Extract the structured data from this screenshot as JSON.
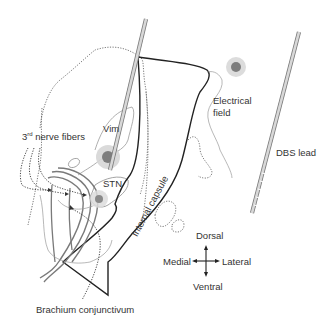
{
  "diagram": {
    "labels": {
      "vim": "Vim",
      "stn": "STN",
      "third_nerve_prefix": "3",
      "third_nerve_sup": "rd",
      "third_nerve_suffix": " nerve fibers",
      "internal_capsule": "Internal capsule",
      "electrical_field_line1": "Electrical",
      "electrical_field_line2": "field",
      "dbs_lead": "DBS lead",
      "brachium": "Brachium conjunctivum"
    },
    "compass": {
      "dorsal": "Dorsal",
      "ventral": "Ventral",
      "medial": "Medial",
      "lateral": "Lateral"
    },
    "colors": {
      "outline": "#222222",
      "dotted": "#555555",
      "thin_gray": "#9a9a9a",
      "fiber_gray": "#7a7a7a",
      "field_halo": "#d6d6d6",
      "field_core": "#7d7d7d",
      "lead_fill": "#cfcfcf",
      "text": "#333333"
    }
  }
}
